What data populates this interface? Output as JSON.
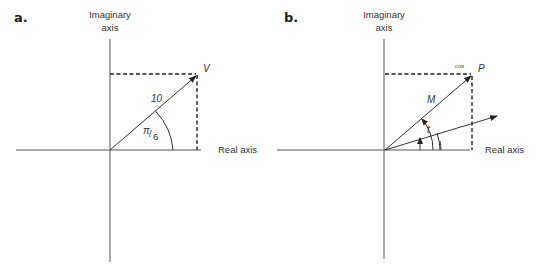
{
  "panels": [
    {
      "label": "a.",
      "y_axis_label_line1": "Imaginary",
      "y_axis_label_line2": "axis",
      "x_axis_label": "Real axis",
      "point_label": "V",
      "magnitude_label": "10",
      "angle_label_num": "π",
      "angle_label_den": "6"
    },
    {
      "label": "b.",
      "y_axis_label_line1": "Imaginary",
      "y_axis_label_line2": "axis",
      "x_axis_label": "Real axis",
      "point_label": "P",
      "point_annotation": "cos",
      "magnitude_label": "M",
      "angle_label": "t"
    }
  ],
  "colors": {
    "line": "#333333",
    "background": "#ffffff"
  }
}
